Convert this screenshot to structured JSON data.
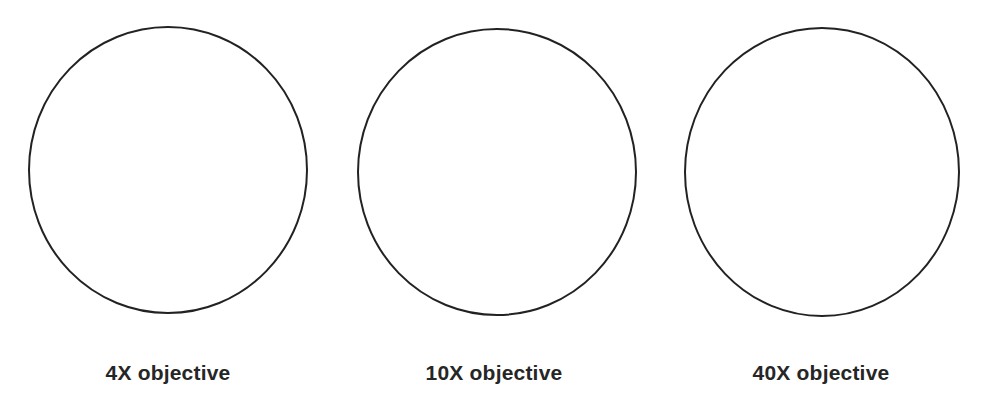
{
  "diagram": {
    "stroke_color": "#222222",
    "label_color": "#262626",
    "fields_of_view": [
      {
        "label": "4X objective",
        "cx": 168,
        "cy": 170,
        "rx": 139,
        "ry": 143,
        "label_x": 168
      },
      {
        "label": "10X objective",
        "cx": 497,
        "cy": 172,
        "rx": 139,
        "ry": 143,
        "label_x": 494
      },
      {
        "label": "40X objective",
        "cx": 822,
        "cy": 172,
        "rx": 137,
        "ry": 144,
        "label_x": 821
      }
    ]
  }
}
